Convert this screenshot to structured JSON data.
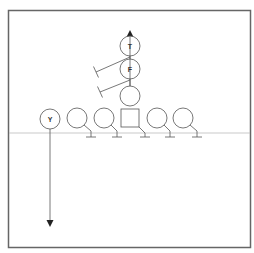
{
  "diagram": {
    "type": "football-play",
    "colors": {
      "frame": "#666666",
      "stroke": "#555555",
      "scrimmage": "#bbbbbb",
      "text": "#333333"
    },
    "players": [
      {
        "id": "T",
        "label": "T",
        "shape": "circle"
      },
      {
        "id": "F",
        "label": "F",
        "shape": "circle"
      },
      {
        "id": "QB",
        "label": "",
        "shape": "circle"
      },
      {
        "id": "Y",
        "label": "Y",
        "shape": "circle"
      },
      {
        "id": "LT",
        "label": "",
        "shape": "circle"
      },
      {
        "id": "LG",
        "label": "",
        "shape": "circle"
      },
      {
        "id": "C",
        "label": "",
        "shape": "square"
      },
      {
        "id": "RG",
        "label": "",
        "shape": "circle"
      },
      {
        "id": "RT",
        "label": "",
        "shape": "circle"
      }
    ],
    "routes": [
      {
        "player": "T",
        "type": "vertical-arrow",
        "direction": "up"
      },
      {
        "player": "Y",
        "type": "vertical-arrow",
        "direction": "down"
      }
    ],
    "blocks": [
      "F",
      "QB",
      "LT",
      "LG",
      "C",
      "RG",
      "RT"
    ]
  }
}
